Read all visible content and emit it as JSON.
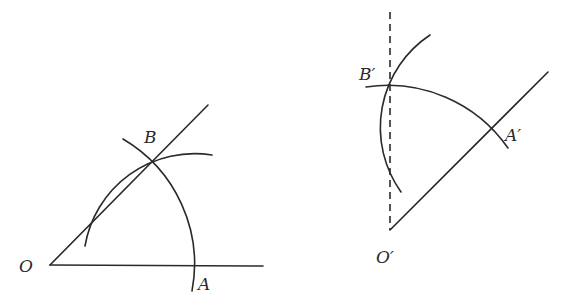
{
  "figures": [
    {
      "name": "original-angle",
      "labels": {
        "vertex": "O",
        "point_a": "A",
        "point_b": "B"
      },
      "points": {
        "O": [
          50,
          265
        ],
        "A": [
          193,
          265
        ],
        "B": [
          152,
          161
        ]
      },
      "ray_end": [
        208,
        105
      ],
      "base_end": [
        263,
        266
      ]
    },
    {
      "name": "copied-angle",
      "labels": {
        "vertex": "O′",
        "point_a": "A′",
        "point_b": "B′"
      },
      "points": {
        "O": [
          390,
          230
        ],
        "A": [
          492,
          128
        ],
        "B": [
          390,
          84
        ]
      },
      "ray_end": [
        548,
        72
      ],
      "dashed_top": [
        390,
        12
      ]
    }
  ],
  "colors": {
    "stroke": "#2a2a2a",
    "background": "#ffffff"
  }
}
